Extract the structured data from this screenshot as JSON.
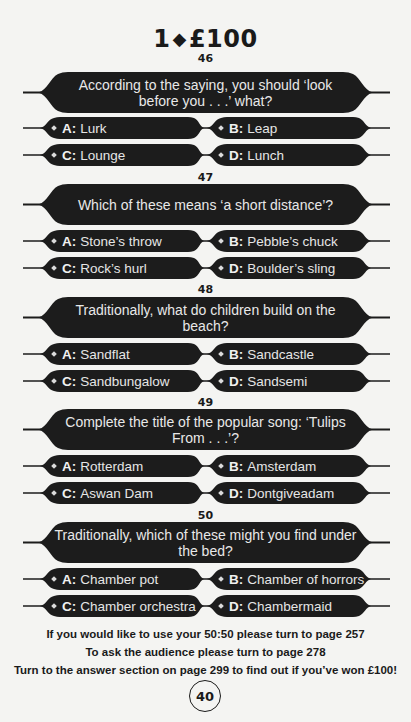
{
  "header": {
    "level": "1",
    "diamond": "◆",
    "prize": "£100"
  },
  "questions": [
    {
      "number": "46",
      "text": "According to the saying, you should ‘look before you . . .’ what?",
      "options": {
        "A": "Lurk",
        "B": "Leap",
        "C": "Lounge",
        "D": "Lunch"
      }
    },
    {
      "number": "47",
      "text": "Which of these means ‘a short distance’?",
      "options": {
        "A": "Stone’s throw",
        "B": "Pebble’s chuck",
        "C": "Rock’s hurl",
        "D": "Boulder’s sling"
      }
    },
    {
      "number": "48",
      "text": "Traditionally, what do children build on the beach?",
      "options": {
        "A": "Sandflat",
        "B": "Sandcastle",
        "C": "Sandbungalow",
        "D": "Sandsemi"
      }
    },
    {
      "number": "49",
      "text": "Complete the title of the popular song: ‘Tulips From . . .’?",
      "options": {
        "A": "Rotterdam",
        "B": "Amsterdam",
        "C": "Aswan Dam",
        "D": "Dontgiveadam"
      }
    },
    {
      "number": "50",
      "text": "Traditionally, which of these might you find under the bed?",
      "options": {
        "A": "Chamber pot",
        "B": "Chamber of horrors",
        "C": "Chamber orchestra",
        "D": "Chambermaid"
      }
    }
  ],
  "labels": {
    "A": "A:",
    "B": "B:",
    "C": "C:",
    "D": "D:"
  },
  "footer": {
    "lifeline_5050": "If you would like to use your 50:50 please turn to page 257",
    "lifeline_audience": "To ask the audience please turn to page 278",
    "answers": "Turn to the answer section on page 299 to find out if you’ve won £100!"
  },
  "page_number": "40",
  "colors": {
    "banner": "#1c1c1c",
    "text_on_banner": "#e8e8e8",
    "page_bg": "#f4f4f2"
  }
}
